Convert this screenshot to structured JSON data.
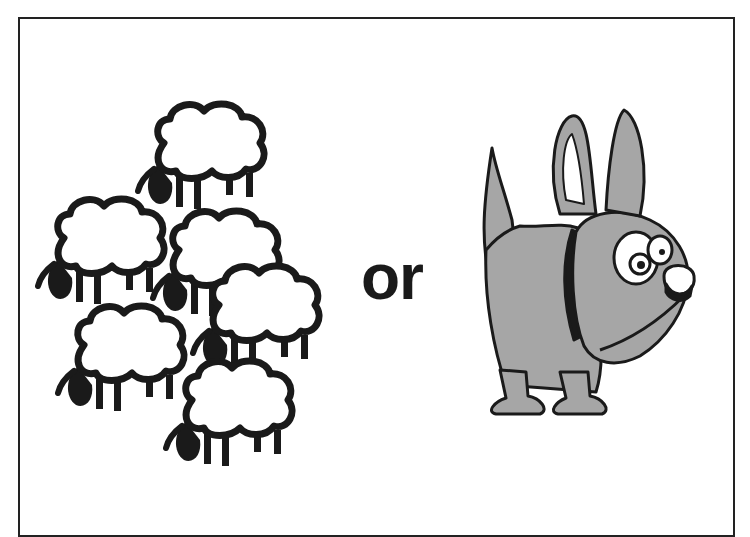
{
  "illustration": {
    "left_image": "flock-of-sheep",
    "sheep_count": 6,
    "center_text": "or",
    "right_image": "cartoon-dog",
    "colors": {
      "outline": "#1a1a1a",
      "sheep_fill": "#ffffff",
      "dog_fill": "#a6a6a6",
      "background": "#ffffff",
      "frame": "#222222"
    }
  }
}
